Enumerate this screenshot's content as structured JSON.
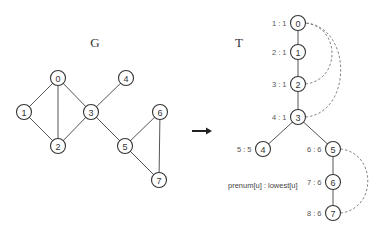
{
  "graph_g": {
    "title": "G",
    "nodes": [
      {
        "id": "0",
        "x": 58,
        "y": 78
      },
      {
        "id": "1",
        "x": 24,
        "y": 112
      },
      {
        "id": "2",
        "x": 58,
        "y": 146
      },
      {
        "id": "3",
        "x": 91,
        "y": 112
      },
      {
        "id": "4",
        "x": 126,
        "y": 78
      },
      {
        "id": "5",
        "x": 125,
        "y": 146
      },
      {
        "id": "6",
        "x": 160,
        "y": 112
      },
      {
        "id": "7",
        "x": 159,
        "y": 180
      }
    ],
    "edges": [
      [
        "0",
        "1"
      ],
      [
        "0",
        "2"
      ],
      [
        "0",
        "3"
      ],
      [
        "1",
        "2"
      ],
      [
        "2",
        "3"
      ],
      [
        "3",
        "4"
      ],
      [
        "3",
        "5"
      ],
      [
        "5",
        "6"
      ],
      [
        "5",
        "7"
      ],
      [
        "6",
        "7"
      ]
    ]
  },
  "arrow": {
    "from": [
      192,
      131
    ],
    "to": [
      212,
      131
    ]
  },
  "tree_t": {
    "title": "T",
    "nodes": [
      {
        "id": "0",
        "x": 298,
        "y": 23,
        "label": "1 : 1"
      },
      {
        "id": "1",
        "x": 298,
        "y": 52,
        "label": "2 : 1"
      },
      {
        "id": "2",
        "x": 298,
        "y": 84,
        "label": "3 : 1"
      },
      {
        "id": "3",
        "x": 298,
        "y": 117,
        "label": "4 : 1"
      },
      {
        "id": "4",
        "x": 263,
        "y": 149,
        "label": "5 : 5"
      },
      {
        "id": "5",
        "x": 333,
        "y": 149,
        "label": "6 : 6"
      },
      {
        "id": "6",
        "x": 333,
        "y": 182,
        "label": "7 : 6"
      },
      {
        "id": "7",
        "x": 333,
        "y": 213,
        "label": "8 : 6"
      }
    ],
    "tree_edges": [
      [
        "0",
        "1"
      ],
      [
        "1",
        "2"
      ],
      [
        "2",
        "3"
      ],
      [
        "3",
        "4"
      ],
      [
        "3",
        "5"
      ],
      [
        "5",
        "6"
      ],
      [
        "6",
        "7"
      ]
    ],
    "back_edges": [
      [
        "2",
        "0"
      ],
      [
        "3",
        "0"
      ],
      [
        "7",
        "5"
      ]
    ],
    "legend": "prenum[u] : lowest[u]"
  }
}
